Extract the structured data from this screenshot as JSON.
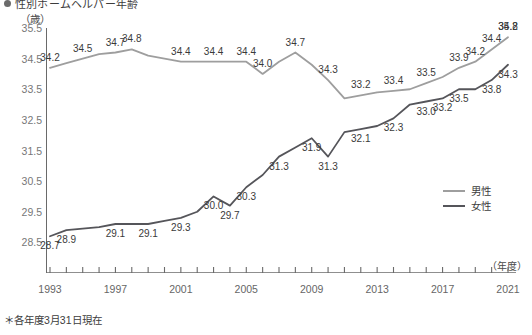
{
  "title": "性別ホームヘルパー年齢",
  "y_axis": {
    "unit": "（歳）",
    "ticks": [
      "35.5",
      "34.5",
      "33.5",
      "32.5",
      "31.5",
      "30.5",
      "29.5",
      "28.5"
    ],
    "min": 27.5,
    "max": 35.5
  },
  "x_axis": {
    "unit": "（年度）",
    "labels": [
      "1993",
      "1997",
      "2001",
      "2005",
      "2009",
      "2013",
      "2017",
      "2021"
    ]
  },
  "legend": {
    "items": [
      {
        "label": "男性",
        "color": "#9e9e9e"
      },
      {
        "label": "女性",
        "color": "#55555a"
      }
    ]
  },
  "footnote": "＊各年度3月31日現在",
  "chart_data": {
    "type": "line",
    "title": "性別ホームヘルパー年齢",
    "xlabel": "（年度）",
    "ylabel": "（歳）",
    "ylim": [
      27.5,
      35.5
    ],
    "ytick_step": 1.0,
    "grid": false,
    "legend_position": "right-middle",
    "x": [
      1993,
      1994,
      1995,
      1996,
      1997,
      1998,
      1999,
      2000,
      2001,
      2002,
      2003,
      2004,
      2005,
      2006,
      2007,
      2008,
      2009,
      2010,
      2011,
      2012,
      2013,
      2014,
      2015,
      2016,
      2017,
      2018,
      2019,
      2020,
      2021
    ],
    "series": [
      {
        "name": "男性",
        "color": "#9e9e9e",
        "values": [
          34.2,
          34.35,
          34.5,
          34.65,
          34.7,
          34.8,
          34.6,
          34.5,
          34.4,
          34.4,
          34.4,
          34.4,
          34.4,
          34.0,
          34.4,
          34.7,
          34.3,
          33.8,
          33.2,
          33.3,
          33.4,
          33.45,
          33.5,
          33.7,
          33.9,
          34.2,
          34.4,
          34.8,
          35.2
        ],
        "labels": [
          {
            "x": 1993,
            "value": "34.2"
          },
          {
            "x": 1995,
            "value": "34.5"
          },
          {
            "x": 1997,
            "value": "34.7"
          },
          {
            "x": 1998,
            "value": "34.8"
          },
          {
            "x": 2001,
            "value": "34.4"
          },
          {
            "x": 2003,
            "value": "34.4"
          },
          {
            "x": 2005,
            "value": "34.4"
          },
          {
            "x": 2006,
            "value": "34.0"
          },
          {
            "x": 2008,
            "value": "34.7"
          },
          {
            "x": 2010,
            "value": "34.3"
          },
          {
            "x": 2012,
            "value": "33.2"
          },
          {
            "x": 2014,
            "value": "33.4"
          },
          {
            "x": 2016,
            "value": "33.5"
          },
          {
            "x": 2018,
            "value": "33.9"
          },
          {
            "x": 2019,
            "value": "34.2"
          },
          {
            "x": 2020,
            "value": "34.4"
          },
          {
            "x": 2021,
            "value": "34.8"
          },
          {
            "x": 2022,
            "value": "35.2"
          }
        ]
      },
      {
        "name": "女性",
        "color": "#55555a",
        "values": [
          28.7,
          28.9,
          28.95,
          29.0,
          29.1,
          29.1,
          29.1,
          29.2,
          29.3,
          29.5,
          30.0,
          29.7,
          30.3,
          30.7,
          31.3,
          31.6,
          31.9,
          31.3,
          32.1,
          32.2,
          32.3,
          32.55,
          33.0,
          33.1,
          33.2,
          33.5,
          33.5,
          33.8,
          34.3
        ],
        "labels": [
          {
            "x": 1993,
            "value": "28.7"
          },
          {
            "x": 1994,
            "value": "28.9"
          },
          {
            "x": 1997,
            "value": "29.1"
          },
          {
            "x": 1999,
            "value": "29.1"
          },
          {
            "x": 2001,
            "value": "29.3"
          },
          {
            "x": 2003,
            "value": "30.0"
          },
          {
            "x": 2004,
            "value": "29.7"
          },
          {
            "x": 2005,
            "value": "30.3"
          },
          {
            "x": 2007,
            "value": "31.3"
          },
          {
            "x": 2009,
            "value": "31.9"
          },
          {
            "x": 2010,
            "value": "31.3"
          },
          {
            "x": 2012,
            "value": "32.1"
          },
          {
            "x": 2014,
            "value": "32.3"
          },
          {
            "x": 2016,
            "value": "33.0"
          },
          {
            "x": 2017,
            "value": "33.2"
          },
          {
            "x": 2018,
            "value": "33.5"
          },
          {
            "x": 2020,
            "value": "33.8"
          },
          {
            "x": 2021,
            "value": "34.3"
          }
        ]
      }
    ]
  }
}
